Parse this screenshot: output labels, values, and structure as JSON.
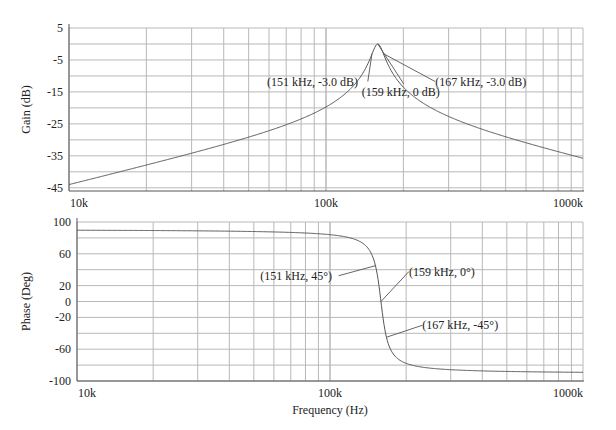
{
  "chart_data": [
    {
      "type": "line",
      "title": "",
      "xlabel": "",
      "ylabel": "Gain (dB)",
      "xscale": "log",
      "xlim": [
        10000,
        1000000
      ],
      "ylim": [
        -46,
        5
      ],
      "grid": true,
      "yticks": [
        5,
        -5,
        -15,
        -25,
        -35,
        -45
      ],
      "ygrid": [
        5,
        0,
        -5,
        -10,
        -15,
        -20,
        -25,
        -30,
        -35,
        -40,
        -45
      ],
      "xtick_labels": [
        "10k",
        "100k",
        "1000k"
      ],
      "series": [
        {
          "name": "Gain",
          "model": "bandpass",
          "f0": 159000,
          "Q": 10,
          "x": [
            10000,
            20000,
            50000,
            100000,
            130000,
            151000,
            159000,
            167000,
            200000,
            300000,
            500000,
            1000000
          ],
          "y": [
            -44,
            -38,
            -29.5,
            -21.5,
            -14,
            -3.0,
            0,
            -3.0,
            -13,
            -23.5,
            -30.5,
            -36
          ]
        }
      ],
      "annotations": [
        {
          "text": "(151 kHz, -3.0 dB)",
          "x": 151000,
          "y": -3.0
        },
        {
          "text": "(159 kHz, 0 dB)",
          "x": 159000,
          "y": 0
        },
        {
          "text": "(167 kHz, -3.0 dB)",
          "x": 167000,
          "y": -3.0
        }
      ]
    },
    {
      "type": "line",
      "title": "",
      "xlabel": "Frequency (Hz)",
      "ylabel": "Phase (Deg)",
      "xscale": "log",
      "xlim": [
        10000,
        1000000
      ],
      "ylim": [
        -100,
        100
      ],
      "grid": true,
      "yticks": [
        100,
        60,
        20,
        0,
        -20,
        -60,
        -100
      ],
      "ygrid": [
        100,
        80,
        60,
        40,
        20,
        0,
        -20,
        -40,
        -60,
        -80,
        -100
      ],
      "xtick_labels": [
        "10k",
        "100k",
        "1000k"
      ],
      "series": [
        {
          "name": "Phase",
          "model": "bandpass",
          "f0": 159000,
          "Q": 10,
          "x": [
            10000,
            50000,
            100000,
            130000,
            151000,
            159000,
            167000,
            200000,
            300000,
            1000000
          ],
          "y": [
            89,
            88,
            85,
            76,
            45,
            0,
            -45,
            -75,
            -86,
            -90
          ]
        }
      ],
      "annotations": [
        {
          "text": "(151 kHz, 45°)",
          "x": 151000,
          "y": 45
        },
        {
          "text": "(159 kHz, 0°)",
          "x": 159000,
          "y": 0
        },
        {
          "text": "(167 kHz, -45°)",
          "x": 167000,
          "y": -45
        }
      ]
    }
  ]
}
